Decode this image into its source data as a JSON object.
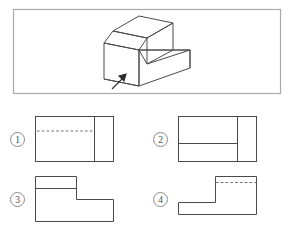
{
  "page": {
    "background_color": "#ffffff",
    "width": 292,
    "height": 229
  },
  "stimulus_panel": {
    "name": "isometric-object-panel",
    "border_color": "#a9a9a9",
    "line_color": "#4a4a4a",
    "rect": {
      "x": 13,
      "y": 9,
      "width": 268,
      "height": 85
    },
    "description": "Isometric pictorial of an L-shaped stepped block",
    "view_direction_arrow": {
      "name": "view-direction-arrow",
      "label": "",
      "from": {
        "x": 113,
        "y": 88
      },
      "to": {
        "x": 126,
        "y": 75
      }
    }
  },
  "options": [
    {
      "id": "1",
      "number_label": "1",
      "name": "option-1",
      "shape": "rectangle-with-vertical-divider-and-hidden-line",
      "has_dashed_line": true,
      "dashed_line_style": "horizontal-hidden-edge"
    },
    {
      "id": "2",
      "number_label": "2",
      "name": "option-2",
      "shape": "rectangle-with-vertical-divider-and-solid-horizontal-line",
      "has_dashed_line": false,
      "dashed_line_style": "none"
    },
    {
      "id": "3",
      "number_label": "3",
      "name": "option-3",
      "shape": "stepped-L-outline-step-upper-left",
      "has_dashed_line": false,
      "dashed_line_style": "none"
    },
    {
      "id": "4",
      "number_label": "4",
      "name": "option-4",
      "shape": "stepped-L-outline-step-lower-left-with-hidden-line",
      "has_dashed_line": true,
      "dashed_line_style": "horizontal-hidden-edge"
    }
  ],
  "colors": {
    "stroke": "#4a4a4a",
    "panel_border": "#a9a9a9",
    "number_circle": "#8a8a8a",
    "background": "#ffffff"
  }
}
